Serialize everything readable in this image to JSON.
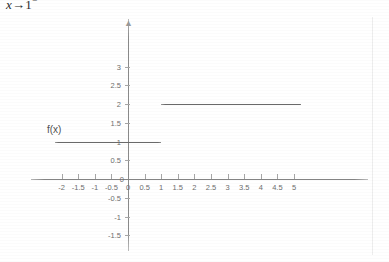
{
  "caption": {
    "prefix": "x",
    "arrow": "→",
    "target": "1",
    "superscript": "−",
    "full_text": "x→1⁻"
  },
  "figure": {
    "curve_label": "f(x)"
  },
  "chart_data": {
    "type": "line",
    "title": "",
    "subtitle": "",
    "xlabel": "",
    "ylabel": "",
    "grid": false,
    "legend": "none",
    "annotations": [
      "f(x)"
    ],
    "xlim": [
      -2.2,
      5.2
    ],
    "ylim": [
      -1.5,
      3.2
    ],
    "x_ticks": [
      -2,
      -1.5,
      -1,
      -0.5,
      0,
      0.5,
      1,
      1.5,
      2,
      2.5,
      3,
      3.5,
      4,
      4.5,
      5
    ],
    "x_tick_labels": [
      "-2",
      "-1.5",
      "-1",
      "-0.5",
      "0",
      "0.5",
      "1",
      "1.5",
      "2",
      "2.5",
      "3",
      "3.5",
      "4",
      "4.5",
      "5"
    ],
    "y_ticks": [
      3,
      2.5,
      2,
      1.5,
      1,
      0.5,
      0,
      -0.5,
      -1,
      -1.5
    ],
    "y_tick_labels": [
      "3",
      "2.5",
      "2",
      "1.5",
      "1",
      "0.5",
      "0",
      "-0.5",
      "-1",
      "-1.5"
    ],
    "series": [
      {
        "name": "f(x) left branch",
        "x": [
          -2.2,
          1.0
        ],
        "y": [
          1,
          1
        ],
        "value": 1
      },
      {
        "name": "f(x) right branch",
        "x": [
          1.0,
          5.2
        ],
        "y": [
          2,
          2
        ],
        "value": 2
      }
    ]
  }
}
